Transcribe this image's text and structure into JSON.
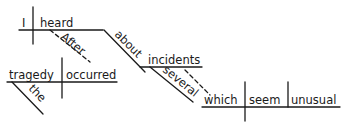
{
  "diagram": {
    "type": "sentence-diagram",
    "main_clause": {
      "subject": "I",
      "verb": "heard",
      "modifiers": {
        "adverb_clause_connector": "After",
        "preposition": "about",
        "object_of_preposition": "incidents",
        "adjective": "several"
      }
    },
    "adverb_clause": {
      "subject": "tragedy",
      "verb": "occurred",
      "article": "the"
    },
    "relative_clause": {
      "subject": "which",
      "verb": "seem",
      "complement": "unusual"
    }
  }
}
